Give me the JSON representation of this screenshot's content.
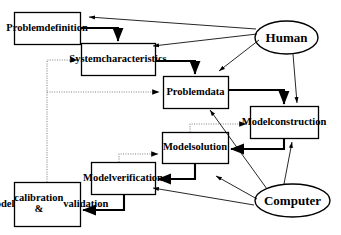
{
  "diagram": {
    "type": "flowchart",
    "width": 341,
    "height": 235,
    "stroke_color": "#000000",
    "dotted_stroke_color": "#808080",
    "fill_color": "#ffffff",
    "background_color": "#ffffff",
    "nodes": [
      {
        "id": "problem_definition",
        "label": "Problem\ndefinition",
        "shape": "rect",
        "x": 14,
        "y": 12,
        "w": 66,
        "h": 32,
        "font_size": 10.5
      },
      {
        "id": "system_characteristics",
        "label": "System\ncharacteristics",
        "shape": "rect",
        "x": 81,
        "y": 43,
        "w": 74,
        "h": 32,
        "font_size": 10.5
      },
      {
        "id": "problem_data",
        "label": "Problem\ndata",
        "shape": "rect",
        "x": 163,
        "y": 76,
        "w": 65,
        "h": 32,
        "font_size": 10.5
      },
      {
        "id": "model_construction",
        "label": "Model\nconstruction",
        "shape": "rect",
        "x": 250,
        "y": 106,
        "w": 68,
        "h": 32,
        "font_size": 10.5
      },
      {
        "id": "model_solution",
        "label": "Model\nsolution",
        "shape": "rect",
        "x": 162,
        "y": 132,
        "w": 66,
        "h": 31,
        "font_size": 10.5
      },
      {
        "id": "model_verification",
        "label": "Model\nverification",
        "shape": "rect",
        "x": 91,
        "y": 162,
        "w": 64,
        "h": 32,
        "font_size": 10.5
      },
      {
        "id": "model_calibration",
        "label": "Model\ncalibration &\nvalidation",
        "shape": "rect",
        "x": 14,
        "y": 182,
        "w": 66,
        "h": 44,
        "font_size": 10.5
      },
      {
        "id": "human",
        "label": "Human",
        "shape": "ellipse",
        "x": 255,
        "y": 21,
        "w": 63,
        "h": 33,
        "font_size": 13
      },
      {
        "id": "computer",
        "label": "Computer",
        "shape": "ellipse",
        "x": 255,
        "y": 184,
        "w": 75,
        "h": 33,
        "font_size": 13
      }
    ],
    "edges": [
      {
        "id": "pd-to-sc",
        "from": "problem_definition",
        "to": "system_characteristics",
        "style": "solid",
        "arrow": true
      },
      {
        "id": "sc-to-pdata",
        "from": "system_characteristics",
        "to": "problem_data",
        "style": "solid",
        "arrow": true
      },
      {
        "id": "pdata-to-mc",
        "from": "problem_data",
        "to": "model_construction",
        "style": "solid",
        "arrow": true
      },
      {
        "id": "mc-to-ms",
        "from": "model_construction",
        "to": "model_solution",
        "style": "solid",
        "arrow": true
      },
      {
        "id": "ms-to-mv",
        "from": "model_solution",
        "to": "model_verification",
        "style": "solid",
        "arrow": true
      },
      {
        "id": "mv-to-mcal",
        "from": "model_verification",
        "to": "model_calibration",
        "style": "solid",
        "arrow": true
      },
      {
        "id": "mcal-to-sc",
        "from": "model_calibration",
        "to": "system_characteristics",
        "style": "dotted",
        "arrow": true
      },
      {
        "id": "mcal-to-pdata",
        "from": "model_calibration",
        "to": "problem_data",
        "style": "dotted",
        "arrow": true
      },
      {
        "id": "mv-to-ms",
        "from": "model_verification",
        "to": "model_solution",
        "style": "dotted",
        "arrow": true
      },
      {
        "id": "ms-to-mc",
        "from": "model_solution",
        "to": "model_construction",
        "style": "dotted",
        "arrow": true
      },
      {
        "id": "human-to-pd",
        "from": "human",
        "to": "problem_definition",
        "style": "solid",
        "arrow": true
      },
      {
        "id": "human-to-sc",
        "from": "human",
        "to": "system_characteristics",
        "style": "solid",
        "arrow": true
      },
      {
        "id": "human-to-pdata",
        "from": "human",
        "to": "problem_data",
        "style": "solid",
        "arrow": true
      },
      {
        "id": "human-to-mc",
        "from": "human",
        "to": "model_construction",
        "style": "solid",
        "arrow": true
      },
      {
        "id": "computer-to-mc",
        "from": "computer",
        "to": "model_construction",
        "style": "solid",
        "arrow": true
      },
      {
        "id": "computer-to-pdata",
        "from": "computer",
        "to": "problem_data",
        "style": "solid",
        "arrow": true
      },
      {
        "id": "computer-to-ms",
        "from": "computer",
        "to": "model_solution",
        "style": "solid",
        "arrow": true
      },
      {
        "id": "computer-to-mv",
        "from": "computer",
        "to": "model_verification",
        "style": "solid",
        "arrow": true
      }
    ]
  }
}
